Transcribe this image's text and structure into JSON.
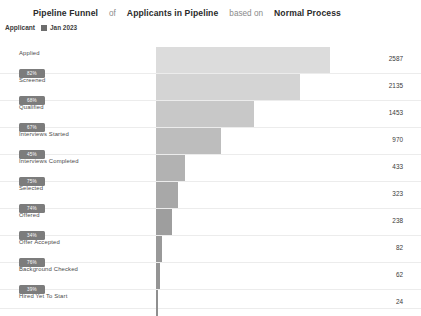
{
  "header": {
    "title": "Pipeline Funnel",
    "of_label": "of",
    "dataset": "Applicants in Pipeline",
    "based_on_label": "based on",
    "process": "Normal Process"
  },
  "subheader": {
    "doctype_label": "Applicant",
    "calendar_icon": "calendar-icon",
    "date_range": "Jan 2023"
  },
  "chart_data": {
    "type": "bar",
    "title": "Pipeline Funnel",
    "xlabel": "",
    "ylabel": "",
    "grid": true,
    "legend": null,
    "orientation": "horizontal-funnel",
    "xlim": [
      0,
      2587
    ],
    "categories": [
      "Applied",
      "Screened",
      "Qualified",
      "Interviews Started",
      "Interviews Completed",
      "Selected",
      "Offered",
      "Offer Accepted",
      "Background Checked",
      "Hired Yet To Start"
    ],
    "values": [
      2587,
      2135,
      1453,
      970,
      433,
      323,
      238,
      82,
      62,
      24
    ],
    "conversion_rates": [
      "82%",
      "68%",
      "67%",
      "45%",
      "75%",
      "74%",
      "34%",
      "76%",
      "39%"
    ],
    "bar_colors": [
      "#dcdcdc",
      "#d4d4d4",
      "#c8c8c8",
      "#bdbdbd",
      "#b2b2b2",
      "#a8a8a8",
      "#9e9e9e",
      "#999999",
      "#949494",
      "#8f8f8f"
    ],
    "grid_color": "#ececec",
    "badge_color": "#7c7c7c"
  }
}
